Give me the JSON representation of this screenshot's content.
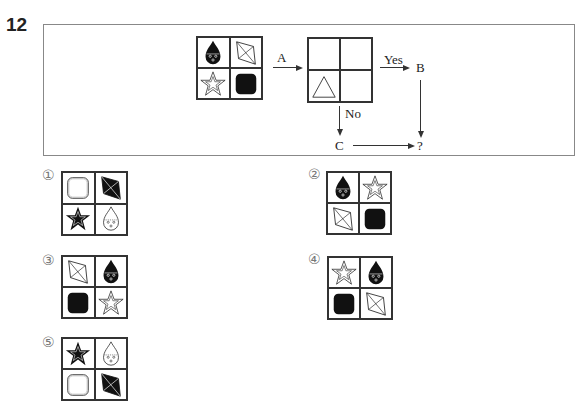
{
  "question": {
    "number": "12",
    "flow": {
      "start_grid": [
        "drop-face-black",
        "kite-outline",
        "star-outline",
        "rounded-square-black"
      ],
      "arrow_a_label": "A",
      "condition_grid": [
        "empty",
        "empty",
        "triangle-outline",
        "empty"
      ],
      "yes_label": "Yes",
      "no_label": "No",
      "b_label": "B",
      "c_label": "C",
      "result_label": "?"
    }
  },
  "options": [
    {
      "marker": "①",
      "cells": [
        "rounded-square-outline",
        "kite-black",
        "star-black",
        "drop-face-outline"
      ]
    },
    {
      "marker": "②",
      "cells": [
        "drop-face-black",
        "star-outline",
        "kite-outline",
        "rounded-square-black"
      ]
    },
    {
      "marker": "③",
      "cells": [
        "kite-outline",
        "drop-face-black",
        "rounded-square-black",
        "star-outline"
      ]
    },
    {
      "marker": "④",
      "cells": [
        "star-outline",
        "drop-face-black",
        "rounded-square-black",
        "kite-outline"
      ]
    },
    {
      "marker": "⑤",
      "cells": [
        "star-black",
        "drop-face-outline",
        "rounded-square-outline",
        "kite-black"
      ]
    }
  ],
  "colors": {
    "ink": "#222222",
    "border": "#888888",
    "marker": "#777777"
  }
}
